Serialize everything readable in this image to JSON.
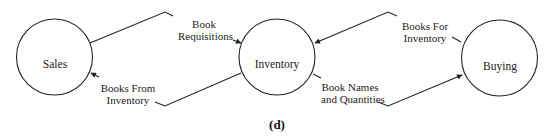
{
  "caption": "(d)",
  "nodes": [
    {
      "id": "sales",
      "label": "Sales"
    },
    {
      "id": "inventory",
      "label": "Inventory"
    },
    {
      "id": "buying",
      "label": "Buying"
    }
  ],
  "flows": [
    {
      "from": "sales",
      "to": "inventory",
      "label_line1": "Book",
      "label_line2": "Requisitions"
    },
    {
      "from": "inventory",
      "to": "sales",
      "label_line1": "Books From",
      "label_line2": "Inventory"
    },
    {
      "from": "buying",
      "to": "inventory",
      "label_line1": "Books For",
      "label_line2": "Inventory"
    },
    {
      "from": "inventory",
      "to": "buying",
      "label_line1": "Book Names",
      "label_line2": "and Quantities"
    }
  ],
  "colors": {
    "stroke": "#222222",
    "background": "#ffffff"
  }
}
